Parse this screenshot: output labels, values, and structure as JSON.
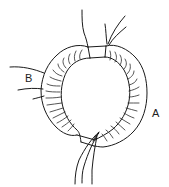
{
  "diagram": {
    "labels": {
      "winding_b": "B",
      "winding_a": "A"
    },
    "colors": {
      "line": "#1a1a1a",
      "background": "#ffffff"
    }
  }
}
